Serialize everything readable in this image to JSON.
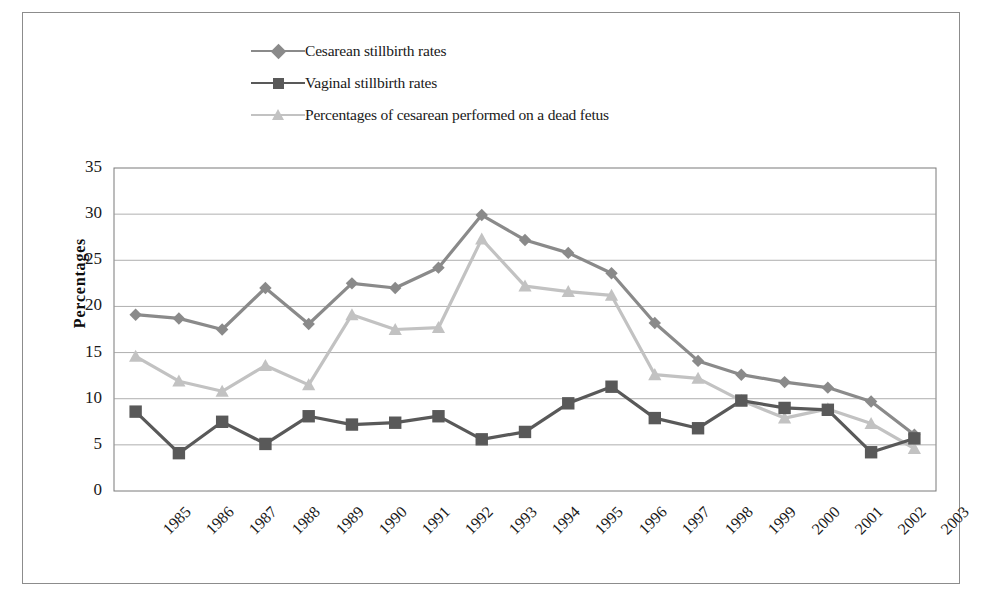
{
  "chart_data": {
    "type": "line",
    "title": "",
    "xlabel": "",
    "ylabel": "Percentages",
    "ylim": [
      0,
      35
    ],
    "yticks": [
      0,
      5,
      10,
      15,
      20,
      25,
      30,
      35
    ],
    "grid": true,
    "legend_position": "top-left",
    "categories": [
      "1985",
      "1986",
      "1987",
      "1988",
      "1989",
      "1990",
      "1991",
      "1992",
      "1993",
      "1994",
      "1995",
      "1996",
      "1997",
      "1998",
      "1999",
      "2000",
      "2001",
      "2002",
      "2003"
    ],
    "series": [
      {
        "name": "Cesarean stillbirth rates",
        "marker": "diamond",
        "color": "#8a8a8a",
        "values": [
          19.1,
          18.7,
          17.5,
          22.0,
          18.1,
          22.5,
          22.0,
          24.2,
          29.9,
          27.2,
          25.8,
          23.6,
          18.2,
          14.1,
          12.6,
          11.8,
          11.2,
          9.7,
          6.1
        ]
      },
      {
        "name": "Vaginal stillbirth rates",
        "marker": "square",
        "color": "#595959",
        "values": [
          8.6,
          4.1,
          7.5,
          5.1,
          8.1,
          7.2,
          7.4,
          8.1,
          5.6,
          6.4,
          9.5,
          11.3,
          7.9,
          6.8,
          9.8,
          9.0,
          8.8,
          4.2,
          5.7
        ]
      },
      {
        "name": "Percentages of cesarean performed on a dead fetus",
        "marker": "triangle",
        "color": "#c2c2c2",
        "values": [
          14.6,
          11.9,
          10.8,
          13.6,
          11.5,
          19.1,
          17.5,
          17.7,
          27.3,
          22.2,
          21.6,
          21.2,
          12.6,
          12.2,
          9.8,
          7.9,
          8.9,
          7.3,
          4.6
        ]
      }
    ]
  },
  "legend": {
    "items": [
      {
        "label": "Cesarean stillbirth rates",
        "marker": "diamond",
        "color": "#8a8a8a"
      },
      {
        "label": "Vaginal stillbirth rates",
        "marker": "square",
        "color": "#595959"
      },
      {
        "label": "Percentages of cesarean performed on a dead fetus",
        "marker": "triangle",
        "color": "#c2c2c2"
      }
    ]
  },
  "axes": {
    "y_title": "Percentages"
  }
}
